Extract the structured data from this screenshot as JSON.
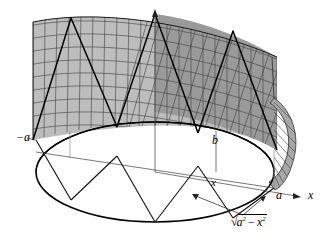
{
  "figure": {
    "type": "3d-math-diagram",
    "background_color": "#ffffff",
    "ink_color": "#000000",
    "surface_fill_light": "#b5b5b5",
    "surface_fill_dark": "#8f8f8f",
    "mesh_line_color": "#3a3a3a"
  },
  "labels": {
    "a": "a",
    "minus_a": "−a",
    "b": "b",
    "x_point": "x",
    "x_axis": "x",
    "radicand_prefix": "√",
    "radicand_a": "a",
    "radicand_a_exp": "2",
    "radicand_minus": "−",
    "radicand_x": "x",
    "radicand_x_exp": "2",
    "radicand_full": "√(a² − x²)"
  },
  "geometry": {
    "origin": [
      155,
      172
    ],
    "z_axis_top": [
      155,
      11
    ],
    "x_axis_right_end": [
      300,
      196
    ],
    "disk_center": [
      155,
      172
    ],
    "disk_rx": 119,
    "disk_ry": 50,
    "left_vertex": [
      36,
      140
    ],
    "right_vertex": [
      274,
      188
    ],
    "wall_top_left": [
      33,
      22
    ],
    "wall_top_right": [
      277,
      57
    ]
  },
  "annotations": {
    "arrow_count": 2,
    "arrow_targets": [
      "front-arc-left",
      "front-arc-right"
    ],
    "axis_arrowheads": [
      "z-axis-top",
      "x-axis-right"
    ]
  }
}
